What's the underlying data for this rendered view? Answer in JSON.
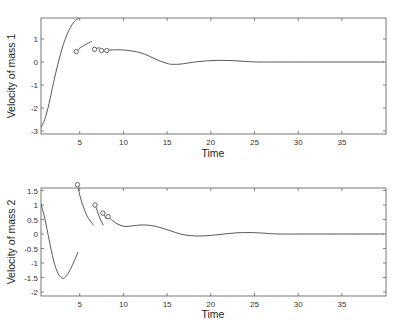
{
  "chart_data": [
    {
      "type": "line",
      "title": "",
      "xlabel": "Time",
      "ylabel": "Velocity of mass 1",
      "xlim": [
        0.55,
        39.8
      ],
      "ylim": [
        -3.1,
        1.9
      ],
      "xticks": [
        5,
        10,
        15,
        20,
        25,
        30,
        35
      ],
      "yticks": [
        1,
        0,
        -1,
        -2,
        -3
      ],
      "grid": false,
      "legend": null,
      "box": {
        "x0": 41,
        "x1": 386,
        "y0": 18,
        "y1": 134,
        "xorigin": 36,
        "xscale": 8.74,
        "yorigin": 62,
        "yscale": 23
      },
      "segments": [
        {
          "x": [
            0.55,
            1.0,
            1.5,
            2.0,
            2.5,
            3.0,
            3.5,
            4.0,
            4.5,
            4.9
          ],
          "y": [
            -2.85,
            -2.5,
            -1.8,
            -0.9,
            -0.1,
            0.6,
            1.15,
            1.55,
            1.8,
            1.9
          ]
        },
        {
          "x": [
            4.6,
            5.0,
            5.5,
            6.0,
            6.4
          ],
          "y": [
            0.45,
            0.6,
            0.72,
            0.82,
            0.9
          ]
        },
        {
          "x": [
            6.7,
            7.0,
            7.3
          ],
          "y": [
            0.55,
            0.6,
            0.62
          ]
        },
        {
          "x": [
            7.5,
            7.8
          ],
          "y": [
            0.5,
            0.52
          ]
        },
        {
          "x": [
            8.1,
            9.0,
            10.0,
            11.0,
            12.0,
            13.0,
            14.0,
            15.0,
            15.5,
            16.5,
            18.0,
            19.5,
            21.0,
            22.5,
            24.0,
            25.5,
            28.0,
            32.0,
            36.0,
            39.8
          ],
          "y": [
            0.5,
            0.53,
            0.52,
            0.48,
            0.4,
            0.25,
            0.07,
            -0.06,
            -0.1,
            -0.09,
            -0.01,
            0.05,
            0.07,
            0.06,
            0.02,
            0.0,
            0.0,
            0.0,
            0.0,
            0.0
          ]
        }
      ],
      "markers": [
        {
          "x": 4.6,
          "y": 0.45
        },
        {
          "x": 6.7,
          "y": 0.55
        },
        {
          "x": 7.5,
          "y": 0.5
        },
        {
          "x": 8.1,
          "y": 0.5
        }
      ]
    },
    {
      "type": "line",
      "title": "",
      "xlabel": "Time",
      "ylabel": "Velocity of mass 2",
      "xlim": [
        0.55,
        39.8
      ],
      "ylim": [
        -2.1,
        1.6
      ],
      "xticks": [
        5,
        10,
        15,
        20,
        25,
        30,
        35
      ],
      "yticks": [
        1.5,
        1,
        0.5,
        0,
        -0.5,
        -1,
        -1.5,
        -2
      ],
      "grid": false,
      "legend": null,
      "box": {
        "x0": 41,
        "x1": 386,
        "y0": 188,
        "y1": 296,
        "xorigin": 36,
        "xscale": 8.74,
        "yorigin": 234,
        "yscale": 29
      },
      "segments": [
        {
          "x": [
            0.55,
            1.0,
            1.5,
            2.0,
            2.5,
            3.0,
            3.3,
            3.7,
            4.2,
            4.8
          ],
          "y": [
            1.05,
            0.55,
            -0.2,
            -0.9,
            -1.35,
            -1.52,
            -1.5,
            -1.35,
            -1.05,
            -0.62
          ]
        },
        {
          "x": [
            4.75,
            5.0,
            5.4,
            5.8,
            6.2,
            6.6
          ],
          "y": [
            1.7,
            1.35,
            0.95,
            0.65,
            0.45,
            0.3
          ]
        },
        {
          "x": [
            6.75,
            7.0,
            7.3,
            7.7
          ],
          "y": [
            1.0,
            0.8,
            0.55,
            0.3
          ]
        },
        {
          "x": [
            7.65,
            7.9,
            8.1
          ],
          "y": [
            0.72,
            0.6,
            0.52
          ]
        },
        {
          "x": [
            8.25,
            8.8,
            9.5,
            10.2,
            11.0,
            12.0,
            13.0,
            14.0,
            15.0,
            16.0,
            17.0,
            18.5,
            20.0,
            21.5,
            23.0,
            24.5,
            26.0,
            28.0,
            32.0,
            39.8
          ],
          "y": [
            0.6,
            0.45,
            0.32,
            0.26,
            0.28,
            0.31,
            0.3,
            0.24,
            0.15,
            0.05,
            -0.03,
            -0.07,
            -0.05,
            0.0,
            0.04,
            0.05,
            0.03,
            0.0,
            0.0,
            0.0
          ]
        }
      ],
      "markers": [
        {
          "x": 4.75,
          "y": 1.7
        },
        {
          "x": 6.75,
          "y": 1.0
        },
        {
          "x": 7.65,
          "y": 0.72
        },
        {
          "x": 8.25,
          "y": 0.6
        }
      ]
    }
  ],
  "top_chart": {
    "ylabel": "Velocity of mass 1",
    "xlabel": "Time",
    "xtick_labels": [
      "5",
      "10",
      "15",
      "20",
      "25",
      "30",
      "35"
    ],
    "ytick_labels": [
      "1",
      "0",
      "-1",
      "-2",
      "-3"
    ]
  },
  "bottom_chart": {
    "ylabel": "Velocity of mass 2",
    "xlabel": "Time",
    "xtick_labels": [
      "5",
      "10",
      "15",
      "20",
      "25",
      "30",
      "35"
    ],
    "ytick_labels": [
      "1.5",
      "1",
      "0.5",
      "0",
      "-0.5",
      "-1",
      "-1.5",
      "-2"
    ]
  }
}
